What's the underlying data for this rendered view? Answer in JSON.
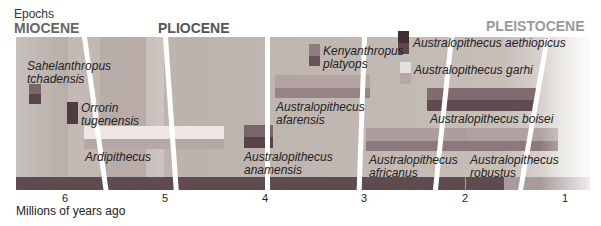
{
  "header": {
    "epochs_label": "Epochs",
    "epochs": [
      "MIOCENE",
      "PLIOCENE",
      "PLEISTOCENE"
    ]
  },
  "axis": {
    "label": "Millions of years ago",
    "ticks": [
      "6",
      "5",
      "4",
      "3",
      "2",
      "1"
    ]
  },
  "species": [
    {
      "name_line1": "Sahelanthropus",
      "name_line2": "tchadensis"
    },
    {
      "name_line1": "Orrorin",
      "name_line2": "tugenensis"
    },
    {
      "name_line1": "Ardipithecus",
      "name_line2": ""
    },
    {
      "name_line1": "Australopithecus",
      "name_line2": "anamensis"
    },
    {
      "name_line1": "Kenyanthropus",
      "name_line2": "platyops"
    },
    {
      "name_line1": "Australopithecus",
      "name_line2": "afarensis"
    },
    {
      "name_line1": "Australopithecus aethiopicus",
      "name_line2": ""
    },
    {
      "name_line1": "Australopithecus garhi",
      "name_line2": ""
    },
    {
      "name_line1": "Australopithecus boisei",
      "name_line2": ""
    },
    {
      "name_line1": "Australopithecus",
      "name_line2": "africanus"
    },
    {
      "name_line1": "Australopithecus",
      "name_line2": "robustus"
    }
  ],
  "colors": {
    "dark_bar": "#5f4b50",
    "mid_bar": "#8e7a7d",
    "light_bar": "#e9e3df",
    "plane": "#c2b8b2"
  }
}
